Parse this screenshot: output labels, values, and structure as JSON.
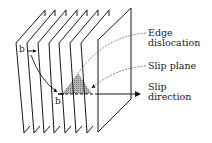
{
  "diagram": {
    "type": "edge-dislocation-schematic",
    "plane_count": 8,
    "labels": {
      "edge_dislocation_line1": "Edge",
      "edge_dislocation_line2": "dislocation",
      "slip_plane": "Slip plane",
      "slip_direction_line1": "Slip",
      "slip_direction_line2": "direction",
      "burgers_top": "b",
      "burgers_bottom": "b"
    },
    "colors": {
      "line": "#1a1a1a",
      "shaded_triangle": "#9a9a9a",
      "leader": "#555555"
    }
  }
}
